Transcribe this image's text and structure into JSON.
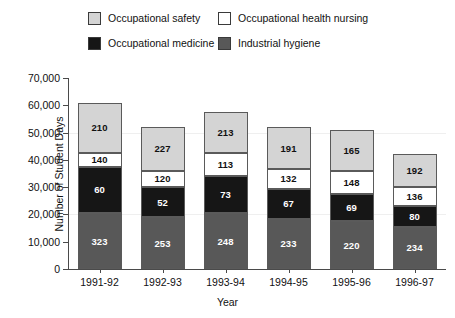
{
  "chart_data": {
    "type": "bar",
    "subtype": "stacked",
    "title": "",
    "xlabel": "Year",
    "ylabel": "Number of Student Days",
    "categories": [
      "1991-92",
      "1992-93",
      "1993-94",
      "1994-95",
      "1995-96",
      "1996-97"
    ],
    "ylim": [
      0,
      70000
    ],
    "ytick_labels": [
      "0",
      "10,000",
      "20,000",
      "30,000",
      "40,000",
      "50,000",
      "60,000",
      "70,000"
    ],
    "ytick_values": [
      0,
      10000,
      20000,
      30000,
      40000,
      50000,
      60000,
      70000
    ],
    "grid": false,
    "legend_position": "top",
    "series": [
      {
        "name": "Industrial hygiene",
        "color": "#585858",
        "point_labels": [
          "323",
          "253",
          "248",
          "233",
          "220",
          "234"
        ],
        "values": [
          20500,
          19000,
          20500,
          18500,
          17500,
          15500
        ]
      },
      {
        "name": "Occupational medicine",
        "color": "#161616",
        "point_labels": [
          "60",
          "52",
          "73",
          "67",
          "69",
          "80"
        ],
        "values": [
          17000,
          11000,
          13500,
          11000,
          10000,
          7500
        ]
      },
      {
        "name": "Occupational health nursing",
        "color": "#ffffff",
        "point_labels": [
          "140",
          "120",
          "113",
          "132",
          "148",
          "136"
        ],
        "values": [
          5000,
          6000,
          8500,
          7000,
          8500,
          7000
        ]
      },
      {
        "name": "Occupational safety",
        "color": "#d4d4d4",
        "point_labels": [
          "210",
          "227",
          "213",
          "191",
          "165",
          "192"
        ],
        "values": [
          18500,
          16000,
          15000,
          15500,
          15000,
          12000
        ]
      }
    ],
    "totals": [
      61000,
      52000,
      57500,
      52000,
      51000,
      42000
    ]
  },
  "legend": {
    "items": [
      {
        "label": "Occupational safety",
        "swatch": "sw-safety"
      },
      {
        "label": "Occupational health nursing",
        "swatch": "sw-nursing"
      },
      {
        "label": "Occupational medicine",
        "swatch": "sw-medicine"
      },
      {
        "label": "Industrial hygiene",
        "swatch": "sw-hygiene"
      }
    ]
  }
}
